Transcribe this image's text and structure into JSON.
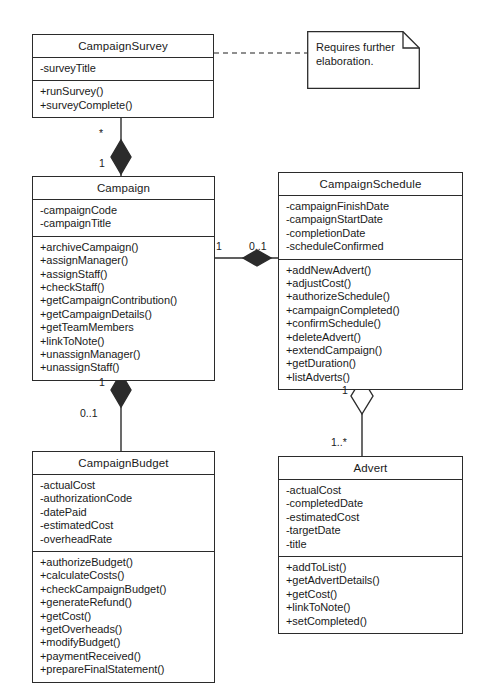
{
  "diagram": {
    "type": "uml-class-diagram"
  },
  "note": {
    "text": "Requires further elaboration."
  },
  "classes": [
    {
      "id": "campaign-survey",
      "name": "CampaignSurvey",
      "attributes": [
        "-surveyTitle"
      ],
      "operations": [
        "+runSurvey()",
        "+surveyComplete()"
      ]
    },
    {
      "id": "campaign",
      "name": "Campaign",
      "attributes": [
        "-campaignCode",
        "-campaignTitle"
      ],
      "operations": [
        "+archiveCampaign()",
        "+assignManager()",
        "+assignStaff()",
        "+checkStaff()",
        "+getCampaignContribution()",
        "+getCampaignDetails()",
        "+getTeamMembers",
        "+linkToNote()",
        "+unassignManager()",
        "+unassignStaff()"
      ]
    },
    {
      "id": "campaign-schedule",
      "name": "CampaignSchedule",
      "attributes": [
        "-campaignFinishDate",
        "-campaignStartDate",
        "-completionDate",
        "-scheduleConfirmed"
      ],
      "operations": [
        "+addNewAdvert()",
        "+adjustCost()",
        "+authorizeSchedule()",
        "+campaignCompleted()",
        "+confirmSchedule()",
        "+deleteAdvert()",
        "+extendCampaign()",
        "+getDuration()",
        "+listAdverts()"
      ]
    },
    {
      "id": "campaign-budget",
      "name": "CampaignBudget",
      "attributes": [
        "-actualCost",
        "-authorizationCode",
        "-datePaid",
        "-estimatedCost",
        "-overheadRate"
      ],
      "operations": [
        "+authorizeBudget()",
        "+calculateCosts()",
        "+checkCampaignBudget()",
        "+generateRefund()",
        "+getCost()",
        "+getOverheads()",
        "+modifyBudget()",
        "+paymentReceived()",
        "+prepareFinalStatement()"
      ]
    },
    {
      "id": "advert",
      "name": "Advert",
      "attributes": [
        "-actualCost",
        "-completedDate",
        "-estimatedCost",
        "-targetDate",
        "-title"
      ],
      "operations": [
        "+addToList()",
        "+getAdvertDetails()",
        "+getCost()",
        "+linkToNote()",
        "+setCompleted()"
      ]
    }
  ],
  "multiplicities": {
    "survey_end": "*",
    "campaign_end_of_survey_link": "1",
    "campaign_end_of_schedule_link": "1",
    "schedule_end": "0..1",
    "campaign_end_of_budget_link": "1",
    "budget_end": "0..1",
    "schedule_end_of_advert_link": "1",
    "advert_end": "1..*"
  },
  "colors": {
    "stroke": "#2b2b2b",
    "fill": "#ffffff",
    "text": "#1a1a1a"
  }
}
